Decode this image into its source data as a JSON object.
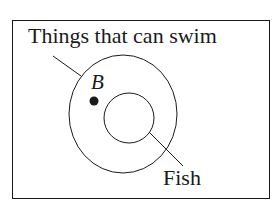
{
  "diagram": {
    "type": "venn",
    "outer_set_label": "Things that can swim",
    "inner_set_label": "Fish",
    "point_label": "B",
    "colors": {
      "stroke": "#1a1a1a",
      "background": "#ffffff"
    }
  }
}
